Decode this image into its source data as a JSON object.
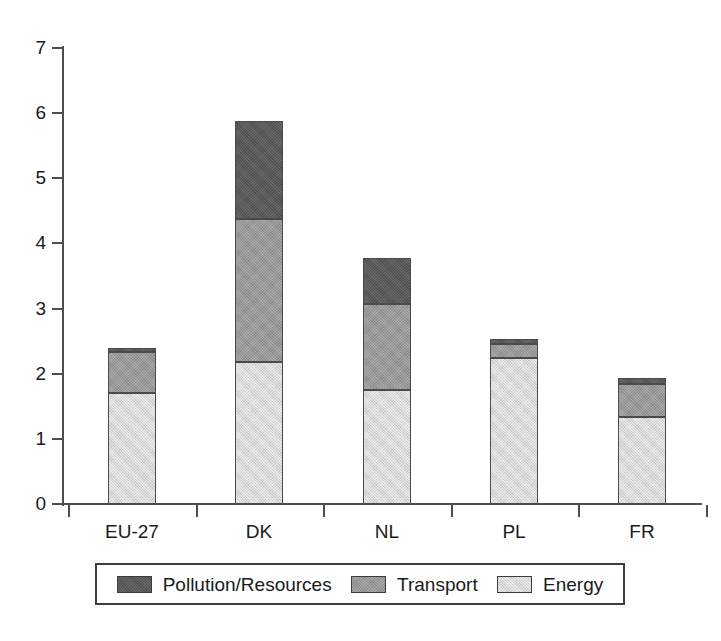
{
  "chart_data": {
    "type": "bar",
    "stacked": true,
    "title": "",
    "subtitle": "",
    "xlabel": "",
    "ylabel": "",
    "categories": [
      "EU-27",
      "DK",
      "NL",
      "PL",
      "FR"
    ],
    "series": [
      {
        "name": "Pollution/Resources",
        "color": "#585858",
        "values": [
          0.07,
          1.5,
          0.7,
          0.07,
          0.09
        ]
      },
      {
        "name": "Transport",
        "color": "#9a9a9a",
        "values": [
          0.63,
          2.2,
          1.32,
          0.22,
          0.5
        ]
      },
      {
        "name": "Energy",
        "color": "#d8d8d8",
        "values": [
          1.7,
          2.18,
          1.75,
          2.24,
          1.34
        ]
      }
    ],
    "stack_order_bottom_to_top": [
      "Energy",
      "Transport",
      "Pollution/Resources"
    ],
    "totals": [
      2.4,
      5.88,
      3.77,
      2.53,
      1.93
    ],
    "ylim": [
      0,
      7
    ],
    "yticks": [
      0,
      1,
      2,
      3,
      4,
      5,
      6,
      7
    ],
    "ytick_labels": [
      "0",
      "1",
      "2",
      "3",
      "4",
      "5",
      "6",
      "7"
    ],
    "grid": false,
    "legend_position": "bottom"
  },
  "axis": {
    "y_tick_labels": [
      "7",
      "6",
      "5",
      "4",
      "3",
      "2",
      "1",
      "0"
    ],
    "x_tick_labels": [
      "EU-27",
      "DK",
      "NL",
      "PL",
      "FR"
    ]
  },
  "legend": {
    "items": [
      {
        "label": "Pollution/Resources",
        "swatch_color": "#585858"
      },
      {
        "label": "Transport",
        "swatch_color": "#9a9a9a"
      },
      {
        "label": "Energy",
        "swatch_color": "#d8d8d8"
      }
    ]
  },
  "caption_fragment": ""
}
